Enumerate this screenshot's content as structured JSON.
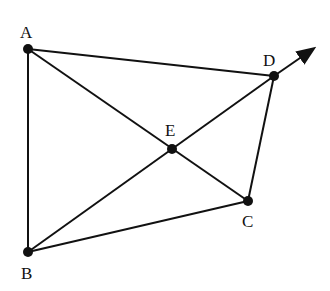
{
  "diagram": {
    "points": [
      {
        "id": "A",
        "label": "A",
        "x": 28,
        "y": 49,
        "lx": 20,
        "ly": 38
      },
      {
        "id": "B",
        "label": "B",
        "x": 28,
        "y": 252,
        "lx": 21,
        "ly": 279
      },
      {
        "id": "C",
        "label": "C",
        "x": 248,
        "y": 201,
        "lx": 242,
        "ly": 227
      },
      {
        "id": "D",
        "label": "D",
        "x": 274,
        "y": 76,
        "lx": 263,
        "ly": 66
      },
      {
        "id": "E",
        "label": "E",
        "x": 172,
        "y": 149,
        "lx": 165,
        "ly": 136
      }
    ],
    "segments": [
      [
        "A",
        "B"
      ],
      [
        "A",
        "D"
      ],
      [
        "A",
        "C"
      ],
      [
        "B",
        "D"
      ],
      [
        "B",
        "C"
      ],
      [
        "C",
        "D"
      ]
    ],
    "ray": {
      "from": "D",
      "to_x": 313,
      "to_y": 49
    },
    "color": "#111111"
  }
}
